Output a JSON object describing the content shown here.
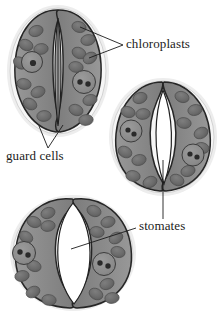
{
  "figure": {
    "background_color": "#ffffff",
    "ink_color": "#1b1b1b",
    "palette": {
      "cytoplasm": "#8d8d8d",
      "cytoplasm_dark": "#7a7a7a",
      "chloroplast": "#6e6e6e",
      "chloroplast_dark": "#5d5d5d",
      "nucleus": "#8f8f8f",
      "nucleolus": "#2a2a2a",
      "halo": "#e3e3e3",
      "pore_open": "#ffffff",
      "outline": "#2b2b2b"
    }
  },
  "labels": [
    {
      "id": "chloroplasts",
      "text": "chloroplasts",
      "x": 126,
      "y": 48,
      "anchor": "start",
      "leader_type": "converging-pair"
    },
    {
      "id": "guard-cells",
      "text": "guard cells",
      "x": 6,
      "y": 160,
      "anchor": "start",
      "leader_type": "converging-pair"
    },
    {
      "id": "stomates",
      "text": "stomates",
      "x": 139,
      "y": 230,
      "anchor": "start",
      "leader_type": "converging-pair"
    }
  ],
  "specimens": [
    {
      "id": "stoma-closed",
      "name": "Closed stomate",
      "state": "closed",
      "position": "top-left",
      "pore_description": "narrow vertical slit, nearly shut"
    },
    {
      "id": "stoma-partially-open",
      "name": "Partially open stomate",
      "state": "partially open",
      "position": "middle-right",
      "pore_description": "narrow lens-shaped aperture"
    },
    {
      "id": "stoma-open",
      "name": "Open stomate",
      "state": "open",
      "position": "bottom-left",
      "pore_description": "wide elliptical aperture"
    }
  ]
}
